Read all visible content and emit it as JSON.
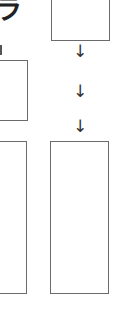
{
  "diagram": {
    "top_left_glyph": "ラ",
    "left_column": {
      "boxes": [
        {
          "label": ""
        },
        {
          "label": ""
        }
      ],
      "arrow_glyph": "↓"
    },
    "right_column": {
      "boxes": [
        {
          "label": ""
        },
        {
          "label": ""
        }
      ],
      "arrows": [
        "↓",
        "↓",
        "↓"
      ]
    },
    "colors": {
      "border": "#6b6b6b",
      "arrow": "#333333",
      "background": "#ffffff"
    }
  }
}
